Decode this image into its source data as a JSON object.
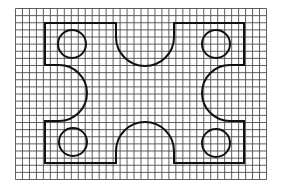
{
  "diagram": {
    "type": "grid-shape-drawing",
    "background": "#ffffff",
    "grid": {
      "x0": 15.5,
      "y0": 8.5,
      "x1": 266.5,
      "y1": 179.5,
      "cols": 36,
      "rows": 24,
      "line_color": "#4d4d4d",
      "line_width": 0.9
    },
    "shape": {
      "stroke": "#111111",
      "stroke_width": 2,
      "outline": {
        "left": 45,
        "right": 244,
        "top": 23,
        "bottom": 163,
        "top_cutout": {
          "x_left": 116,
          "x_right": 174,
          "bottom_y": 66
        },
        "bottom_cutout": {
          "x_left": 116,
          "x_right": 174,
          "top_y": 122
        },
        "left_cutout": {
          "y_top": 65,
          "y_bottom": 121,
          "x_start": 58,
          "max_x": 87
        },
        "right_cutout": {
          "y_top": 65,
          "y_bottom": 121,
          "x_start": 231,
          "min_x": 202
        }
      },
      "circles": [
        {
          "name": "top-left-hole",
          "cx": 72,
          "cy": 44,
          "r": 14
        },
        {
          "name": "top-right-hole",
          "cx": 216,
          "cy": 44,
          "r": 14
        },
        {
          "name": "bottom-left-hole",
          "cx": 73,
          "cy": 142,
          "r": 14
        },
        {
          "name": "bottom-right-hole",
          "cx": 216,
          "cy": 143,
          "r": 14
        }
      ]
    }
  }
}
